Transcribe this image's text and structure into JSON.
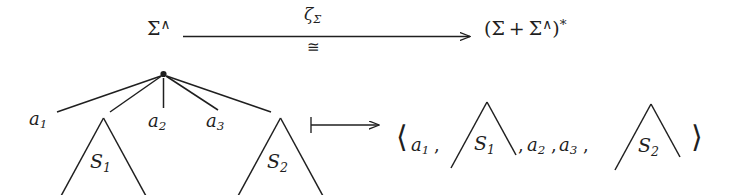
{
  "figure": {
    "kind": "commutative-diagram",
    "background_color": "#ffffff",
    "ink_color": "#1f1f1f"
  },
  "top_row": {
    "source_object": {
      "base": "Σ",
      "superscript": "∧",
      "full": "Σ^"
    },
    "arrow": {
      "kind": "long-rightarrow",
      "glyph": "⟶",
      "label_above": {
        "base": "ζ",
        "subscript": "Σ",
        "full": "ζΣ"
      },
      "label_below": {
        "glyph": "≅",
        "full": "≅"
      }
    },
    "target_object": {
      "open_paren": "(",
      "first": "Σ",
      "plus": "+",
      "second_base": "Σ",
      "second_superscript": "∧",
      "close_paren": ")",
      "star": "*",
      "full": "(Σ + Σ^)*"
    }
  },
  "bottom_row": {
    "left_tree": {
      "root_marker": "•",
      "children": [
        {
          "kind": "leaf",
          "label": "a",
          "subscript": "1",
          "full": "a₁"
        },
        {
          "kind": "subtree",
          "label": "𝒆",
          "subscript": "1",
          "full": "S₁"
        },
        {
          "kind": "leaf",
          "label": "a",
          "subscript": "2",
          "full": "a₂"
        },
        {
          "kind": "leaf",
          "label": "a",
          "subscript": "3",
          "full": "a₃"
        },
        {
          "kind": "subtree",
          "label": "𝒆",
          "subscript": "2",
          "full": "S₂"
        }
      ],
      "leaf_labels": {
        "a1": {
          "base": "a",
          "subscript": "1"
        },
        "a2": {
          "base": "a",
          "subscript": "2"
        },
        "a3": {
          "base": "a",
          "subscript": "3"
        }
      },
      "subtree_labels": {
        "s1": {
          "base": "S",
          "subscript": "1"
        },
        "s2": {
          "base": "S",
          "subscript": "2"
        }
      }
    },
    "maps_to_arrow": {
      "kind": "mapsto",
      "glyph": "⟼",
      "full": "↦"
    },
    "right_tuple": {
      "open_bracket": "⟨",
      "close_bracket": "⟩",
      "separator": ",",
      "items": [
        {
          "kind": "symbol",
          "base": "a",
          "subscript": "1",
          "full": "a₁"
        },
        {
          "kind": "triangle",
          "base": "S",
          "subscript": "1",
          "full": "S₁"
        },
        {
          "kind": "symbol",
          "base": "a",
          "subscript": "2",
          "full": "a₂"
        },
        {
          "kind": "symbol",
          "base": "a",
          "subscript": "3",
          "full": "a₃"
        },
        {
          "kind": "triangle",
          "base": "S",
          "subscript": "2",
          "full": "S₂"
        }
      ],
      "full": "⟨a₁, △S₁, a₂, a₃, △S₂⟩"
    }
  }
}
